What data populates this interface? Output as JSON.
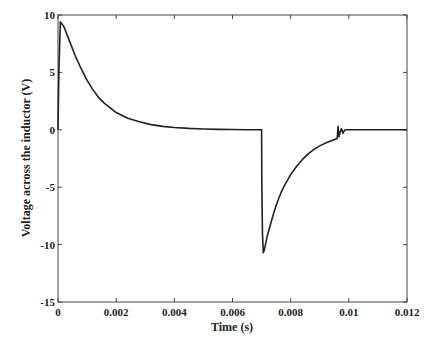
{
  "chart_data": {
    "type": "line",
    "title": "",
    "xlabel": "Time (s)",
    "ylabel": "Voltage across the inductor (V)",
    "xlim": [
      0,
      0.012
    ],
    "ylim": [
      -15,
      10
    ],
    "xticks": [
      0,
      0.002,
      0.004,
      0.006,
      0.008,
      0.01,
      0.012
    ],
    "xtick_labels": [
      "0",
      "0.002",
      "0.004",
      "0.006",
      "0.008",
      "0.01",
      "0.012"
    ],
    "yticks": [
      -15,
      -10,
      -5,
      0,
      5,
      10
    ],
    "ytick_labels": [
      "-15",
      "-10",
      "-5",
      "0",
      "5",
      "10"
    ],
    "grid": false,
    "legend": null,
    "line_color": "#222222",
    "series": [
      {
        "name": "Inductor voltage",
        "x": [
          0,
          3e-05,
          8e-05,
          0.0002,
          0.0004,
          0.0006,
          0.0008,
          0.001,
          0.0012,
          0.0014,
          0.0016,
          0.0018,
          0.002,
          0.0024,
          0.0028,
          0.0032,
          0.0036,
          0.004,
          0.0045,
          0.005,
          0.0055,
          0.006,
          0.0065,
          0.007,
          0.00701,
          0.00703,
          0.00706,
          0.0071,
          0.00715,
          0.0072,
          0.0073,
          0.0074,
          0.0075,
          0.0076,
          0.0077,
          0.0078,
          0.008,
          0.0082,
          0.0084,
          0.0086,
          0.0088,
          0.009,
          0.0092,
          0.0094,
          0.0096,
          0.00963,
          0.00966,
          0.0097,
          0.00975,
          0.0098,
          0.00985,
          0.0099,
          0.00995,
          0.01,
          0.0102,
          0.0105,
          0.011,
          0.0115,
          0.012
        ],
        "y": [
          0,
          5,
          9.4,
          9.0,
          7.7,
          6.4,
          5.3,
          4.3,
          3.5,
          2.8,
          2.3,
          1.9,
          1.5,
          1.0,
          0.7,
          0.45,
          0.3,
          0.2,
          0.12,
          0.07,
          0.04,
          0.02,
          0.01,
          0,
          -5,
          -9,
          -10.7,
          -10.4,
          -9.8,
          -9.2,
          -8.3,
          -7.4,
          -6.6,
          -5.9,
          -5.3,
          -4.8,
          -3.9,
          -3.2,
          -2.6,
          -2.1,
          -1.7,
          -1.4,
          -1.15,
          -0.95,
          -0.75,
          0.3,
          -0.6,
          -0.2,
          0.1,
          -0.3,
          -0.05,
          0,
          0,
          0,
          0,
          0,
          0,
          0,
          0
        ]
      }
    ]
  }
}
